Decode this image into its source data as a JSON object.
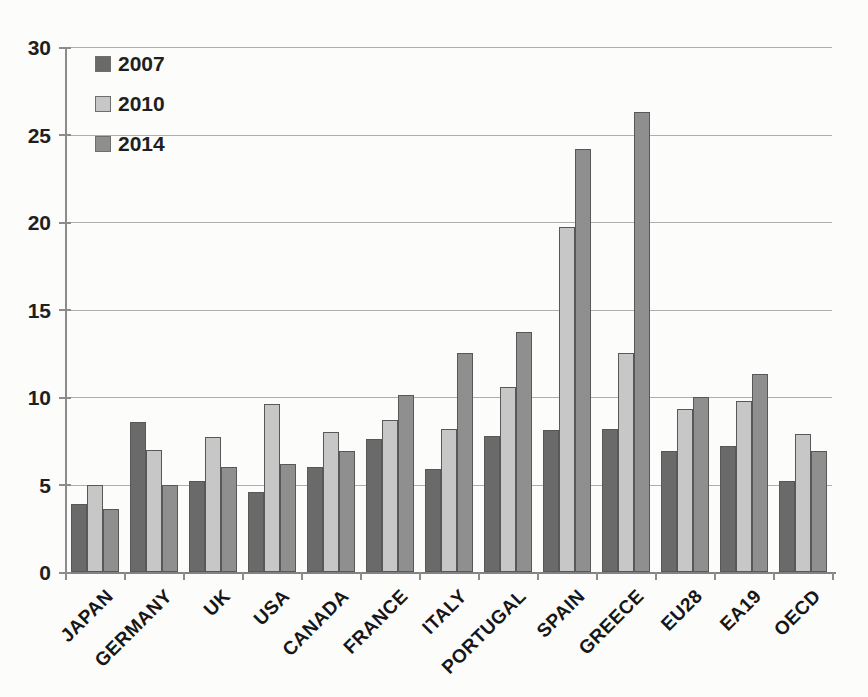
{
  "chart_data": {
    "type": "bar",
    "title": "",
    "categories": [
      "JAPAN",
      "GERMANY",
      "UK",
      "USA",
      "CANADA",
      "FRANCE",
      "ITALY",
      "PORTUGAL",
      "SPAIN",
      "GREECE",
      "EU28",
      "EA19",
      "OECD"
    ],
    "series": [
      {
        "name": "2007",
        "color": "#6a6a6a",
        "values": [
          3.9,
          8.6,
          5.2,
          4.6,
          6.0,
          7.6,
          5.9,
          7.8,
          8.1,
          8.2,
          6.9,
          7.2,
          5.2
        ]
      },
      {
        "name": "2010",
        "color": "#c7c7c7",
        "values": [
          5.0,
          7.0,
          7.7,
          9.6,
          8.0,
          8.7,
          8.2,
          10.6,
          19.7,
          12.5,
          9.3,
          9.8,
          7.9
        ]
      },
      {
        "name": "2014",
        "color": "#8f8f8f",
        "values": [
          3.6,
          5.0,
          6.0,
          6.2,
          6.9,
          10.1,
          12.5,
          13.7,
          24.2,
          26.3,
          10.0,
          11.3,
          6.9
        ]
      }
    ],
    "xlabel": "",
    "ylabel": "",
    "ylim": [
      0,
      30
    ],
    "yticks": [
      0,
      5,
      10,
      15,
      20,
      25,
      30
    ],
    "grid": true,
    "legend_position": "top-left",
    "legend_labels": [
      "2007",
      "2010",
      "2014"
    ]
  }
}
